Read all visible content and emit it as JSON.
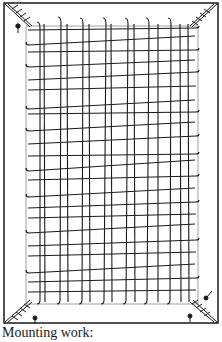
{
  "figure": {
    "caption": "Mounting work:",
    "colors": {
      "ink": "#1a1a1a",
      "paper": "#ffffff"
    },
    "frame": {
      "outer": [
        4,
        4,
        218,
        322
      ],
      "inner": [
        22,
        22,
        200,
        304
      ]
    },
    "grid": {
      "vertical_threads": 14,
      "horizontal_threads": 22
    }
  }
}
